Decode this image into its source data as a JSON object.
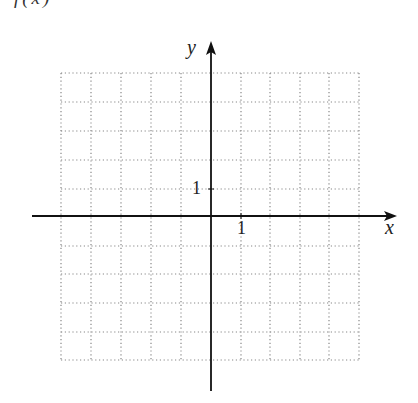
{
  "header": {
    "clipped_text": "f(x)"
  },
  "graph": {
    "x_axis_label": "x",
    "y_axis_label": "y",
    "x_tick_label": "1",
    "y_tick_label": "1",
    "grid": {
      "x_min": -5,
      "x_max": 5,
      "y_min": -5,
      "y_max": 5,
      "step": 1,
      "style": "dotted"
    },
    "colors": {
      "axis": "#111111",
      "grid": "#888888",
      "background": "#ffffff"
    }
  }
}
